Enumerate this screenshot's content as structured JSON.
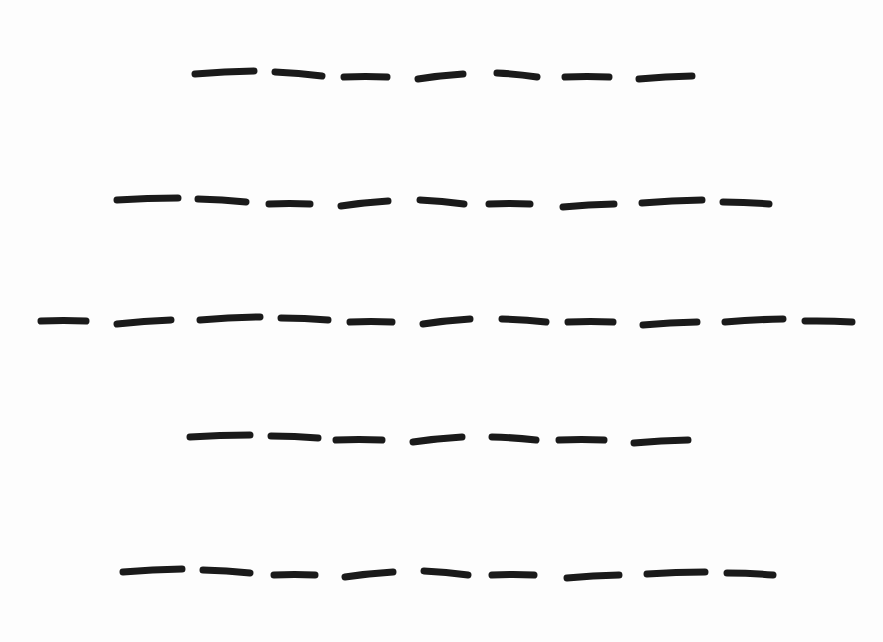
{
  "page": {
    "background": "#fdfdfd",
    "ink_color": "#1a1a1a",
    "stroke_width": 7
  },
  "puzzle": {
    "rows": [
      {
        "letter_count": 7,
        "blanks": [
          [
            195,
            74,
            254,
            71
          ],
          [
            275,
            72,
            322,
            76
          ],
          [
            344,
            77,
            387,
            77
          ],
          [
            418,
            79,
            463,
            74
          ],
          [
            497,
            73,
            537,
            77
          ],
          [
            565,
            77,
            609,
            77
          ],
          [
            639,
            79,
            692,
            76
          ]
        ]
      },
      {
        "letter_count": 9,
        "blanks": [
          [
            117,
            200,
            178,
            198
          ],
          [
            198,
            199,
            246,
            202
          ],
          [
            269,
            204,
            310,
            204
          ],
          [
            341,
            206,
            388,
            201
          ],
          [
            420,
            200,
            464,
            204
          ],
          [
            489,
            204,
            530,
            204
          ],
          [
            563,
            207,
            614,
            204
          ],
          [
            642,
            203,
            702,
            200
          ],
          [
            723,
            202,
            769,
            204
          ]
        ]
      },
      {
        "letter_count": 11,
        "blanks": [
          [
            41,
            321,
            86,
            321
          ],
          [
            117,
            324,
            171,
            320
          ],
          [
            200,
            320,
            260,
            317
          ],
          [
            281,
            318,
            328,
            320
          ],
          [
            350,
            322,
            392,
            322
          ],
          [
            423,
            324,
            470,
            319
          ],
          [
            502,
            319,
            546,
            322
          ],
          [
            568,
            322,
            613,
            322
          ],
          [
            643,
            325,
            697,
            322
          ],
          [
            725,
            322,
            783,
            319
          ],
          [
            805,
            321,
            852,
            322
          ]
        ]
      },
      {
        "letter_count": 7,
        "blanks": [
          [
            190,
            437,
            250,
            435
          ],
          [
            271,
            436,
            318,
            438
          ],
          [
            336,
            440,
            382,
            440
          ],
          [
            413,
            442,
            462,
            437
          ],
          [
            492,
            437,
            536,
            440
          ],
          [
            559,
            440,
            604,
            440
          ],
          [
            634,
            443,
            688,
            440
          ]
        ]
      },
      {
        "letter_count": 9,
        "blanks": [
          [
            123,
            572,
            182,
            569
          ],
          [
            203,
            570,
            250,
            573
          ],
          [
            274,
            575,
            315,
            575
          ],
          [
            345,
            577,
            393,
            572
          ],
          [
            424,
            571,
            468,
            575
          ],
          [
            492,
            575,
            534,
            575
          ],
          [
            567,
            578,
            619,
            575
          ],
          [
            647,
            574,
            705,
            572
          ],
          [
            727,
            573,
            773,
            575
          ]
        ]
      }
    ]
  }
}
